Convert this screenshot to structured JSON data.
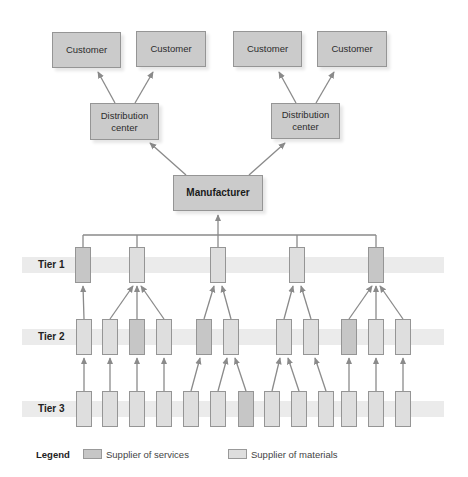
{
  "colors": {
    "services": "#c6c6c6",
    "materials": "#dedede",
    "big_box": "#cbcbcb",
    "band": "#ebebeb",
    "line": "#8a8a8a"
  },
  "top_nodes": [
    {
      "id": "customer-1",
      "label": "Customer",
      "x": 52,
      "y": 32,
      "w": 69,
      "h": 36
    },
    {
      "id": "customer-2",
      "label": "Customer",
      "x": 136,
      "y": 31,
      "w": 70,
      "h": 36
    },
    {
      "id": "customer-3",
      "label": "Customer",
      "x": 233,
      "y": 31,
      "w": 69,
      "h": 36
    },
    {
      "id": "customer-4",
      "label": "Customer",
      "x": 317,
      "y": 31,
      "w": 70,
      "h": 36
    },
    {
      "id": "distribution-center-1",
      "label": "Distribution\ncenter",
      "x": 90,
      "y": 103,
      "w": 69,
      "h": 37
    },
    {
      "id": "distribution-center-2",
      "label": "Distribution\ncenter",
      "x": 271,
      "y": 103,
      "w": 69,
      "h": 36
    },
    {
      "id": "manufacturer",
      "label": "Manufacturer",
      "x": 173,
      "y": 175,
      "w": 90,
      "h": 36,
      "bold": true
    }
  ],
  "tiers": [
    {
      "label": "Tier 1",
      "band_y": 257,
      "band_h": 16,
      "box_y": 247,
      "boxes": [
        {
          "x": 75,
          "type": "services"
        },
        {
          "x": 129,
          "type": "materials"
        },
        {
          "x": 210,
          "type": "materials"
        },
        {
          "x": 289,
          "type": "materials"
        },
        {
          "x": 368,
          "type": "services"
        }
      ]
    },
    {
      "label": "Tier 2",
      "band_y": 329,
      "band_h": 16,
      "box_y": 319,
      "boxes": [
        {
          "x": 76,
          "type": "materials",
          "parent": 0
        },
        {
          "x": 102,
          "type": "materials",
          "parent": 1
        },
        {
          "x": 129,
          "type": "services",
          "parent": 1
        },
        {
          "x": 156,
          "type": "materials",
          "parent": 1
        },
        {
          "x": 196,
          "type": "services",
          "parent": 2
        },
        {
          "x": 223,
          "type": "materials",
          "parent": 2
        },
        {
          "x": 276,
          "type": "materials",
          "parent": 3
        },
        {
          "x": 303,
          "type": "materials",
          "parent": 3
        },
        {
          "x": 341,
          "type": "services",
          "parent": 4
        },
        {
          "x": 368,
          "type": "materials",
          "parent": 4
        },
        {
          "x": 395,
          "type": "materials",
          "parent": 4
        }
      ]
    },
    {
      "label": "Tier 3",
      "band_y": 401,
      "band_h": 16,
      "box_y": 391,
      "boxes": [
        {
          "x": 76,
          "type": "materials",
          "parent": 0
        },
        {
          "x": 102,
          "type": "materials",
          "parent": 1
        },
        {
          "x": 129,
          "type": "materials",
          "parent": 2
        },
        {
          "x": 156,
          "type": "materials",
          "parent": 3
        },
        {
          "x": 183,
          "type": "materials",
          "parent": 4
        },
        {
          "x": 210,
          "type": "materials",
          "parent": 5
        },
        {
          "x": 238,
          "type": "services",
          "parent": 5
        },
        {
          "x": 264,
          "type": "materials",
          "parent": 6
        },
        {
          "x": 291,
          "type": "materials",
          "parent": 6
        },
        {
          "x": 318,
          "type": "materials",
          "parent": 7
        },
        {
          "x": 341,
          "type": "materials",
          "parent": 8
        },
        {
          "x": 368,
          "type": "materials",
          "parent": 9
        },
        {
          "x": 395,
          "type": "materials",
          "parent": 10
        }
      ]
    }
  ],
  "supplier_box": {
    "w": 16,
    "h": 36
  },
  "band": {
    "x": 22,
    "w": 422
  },
  "top_edges": [
    {
      "from": "distribution-center-1",
      "to": "customer-1",
      "fx": 115,
      "fy": 103,
      "tx": 98,
      "ty": 72
    },
    {
      "from": "distribution-center-1",
      "to": "customer-2",
      "fx": 135,
      "fy": 103,
      "tx": 153,
      "ty": 72
    },
    {
      "from": "distribution-center-2",
      "to": "customer-3",
      "fx": 296,
      "fy": 103,
      "tx": 279,
      "ty": 72
    },
    {
      "from": "distribution-center-2",
      "to": "customer-4",
      "fx": 316,
      "fy": 103,
      "tx": 334,
      "ty": 72
    },
    {
      "from": "manufacturer",
      "to": "distribution-center-1",
      "fx": 186,
      "fy": 175,
      "tx": 150,
      "ty": 143
    },
    {
      "from": "manufacturer",
      "to": "distribution-center-2",
      "fx": 249,
      "fy": 175,
      "tx": 285,
      "ty": 143
    }
  ],
  "bus": {
    "y": 235,
    "x1": 83,
    "x2": 376,
    "mx": 218,
    "my_top": 215
  },
  "legend": {
    "title": "Legend",
    "items": [
      {
        "label": "Supplier of services",
        "type": "services"
      },
      {
        "label": "Supplier of materials",
        "type": "materials"
      }
    ]
  }
}
